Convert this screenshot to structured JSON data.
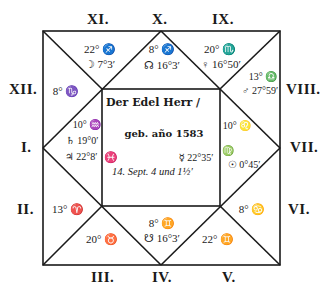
{
  "chart_title": "Horoscope square chart",
  "colors": {
    "ink": "#1a1a1a",
    "paper": "#ffffff"
  },
  "center": {
    "line1": "Der Edel Herr /",
    "line2": "geb. año 1583",
    "line3": "14. Sept. 4 und 1½′"
  },
  "inner_edges": {
    "left_sign": "♓",
    "right_sign": "♍",
    "mercury": "☿ 22°35′",
    "sun": "☉ 0°45′"
  },
  "house_labels": {
    "I": "I.",
    "II": "II.",
    "III": "III.",
    "IV": "IV.",
    "V": "V.",
    "VI": "VI.",
    "VII": "VII.",
    "VIII": "VIII.",
    "IX": "IX.",
    "X": "X.",
    "XI": "XI.",
    "XII": "XII."
  },
  "houses": {
    "X": {
      "cusp": "8° ♐",
      "planet": "☊ 16°3′"
    },
    "XI": {
      "cusp": "22° ♐",
      "planet": "☽ 7°3′"
    },
    "IX": {
      "cusp": "20° ♏",
      "planet": "♀ 16°50′"
    },
    "XII": {
      "cusp": "8° ♑"
    },
    "VIII": {
      "cusp": "13° ♎",
      "planet": "♂ 27°59′"
    },
    "I": {
      "cusp": "10° ♒",
      "planet1": "♄ 19°0′",
      "planet2": "♃ 22°8′"
    },
    "VII": {
      "cusp": "10° ♌"
    },
    "II": {
      "cusp": "13° ♈"
    },
    "VI": {
      "cusp": "8° ♋"
    },
    "III": {
      "cusp": "20° ♉"
    },
    "IV": {
      "cusp": "8° ♊",
      "planet": "☋ 16°3′"
    },
    "V": {
      "cusp": "22° ♊"
    }
  }
}
